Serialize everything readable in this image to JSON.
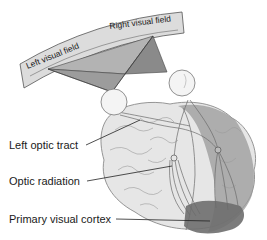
{
  "diagram": {
    "type": "anatomical-illustration",
    "visual_field_labels": {
      "left": "Left visual field",
      "right": "Right visual field"
    },
    "callouts": [
      {
        "id": "left-optic-tract",
        "label": "Left optic tract"
      },
      {
        "id": "optic-radiation",
        "label": "Optic radiation"
      },
      {
        "id": "primary-visual-cortex",
        "label": "Primary visual cortex"
      }
    ],
    "colors": {
      "band_fill": "#dcdcdc",
      "band_stroke": "#555555",
      "triangle_light": "#b3b3b3",
      "triangle_dark": "#8a8a8a",
      "brain_fill": "#e6e6e6",
      "brain_stroke": "#8a8a8a",
      "hemisphere_shade": "#9a9a9a",
      "cortex_dark": "#6e6e6e",
      "leader_line": "#222222"
    }
  }
}
